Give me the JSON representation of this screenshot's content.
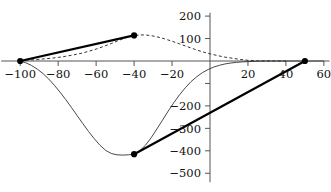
{
  "chart_data": {
    "type": "line",
    "title": "",
    "subtitle": "",
    "xlabel": "",
    "ylabel": "",
    "xlim": [
      -110,
      63
    ],
    "ylim": [
      -540,
      215
    ],
    "grid": false,
    "legend": null,
    "x_ticks": [
      -100,
      -80,
      -60,
      -40,
      -20,
      20,
      40,
      60
    ],
    "x_tick_labels": [
      "-100",
      "-80",
      "-60",
      "-40",
      "-20",
      "20",
      "40",
      "60"
    ],
    "y_ticks": [
      200,
      100,
      -100,
      -200,
      -300,
      -400,
      -500
    ],
    "y_tick_labels": [
      "200",
      "100",
      "",
      "-200",
      "-300",
      "-400",
      "-500"
    ],
    "y_tick_labels_visible": [
      "200",
      "100",
      "-200",
      "-300",
      "-400",
      "-500"
    ],
    "series": [
      {
        "name": "solid-curve",
        "style": "solid-thin",
        "color": "#333333",
        "x": [
          -100,
          -97,
          -94,
          -91,
          -88,
          -85,
          -82,
          -79,
          -76,
          -73,
          -70,
          -67,
          -64,
          -61,
          -58,
          -55,
          -52,
          -49,
          -46,
          -43,
          -40,
          -37,
          -34,
          -31,
          -28,
          -25,
          -22,
          -19,
          -16,
          -13,
          -10,
          -7,
          -4,
          -1,
          2,
          5,
          8,
          11,
          14,
          17,
          20,
          25,
          30,
          35,
          40,
          45,
          50,
          55,
          60
        ],
        "y": [
          0,
          -8,
          -20,
          -36,
          -56,
          -80,
          -108,
          -139,
          -172,
          -207,
          -243,
          -279,
          -314,
          -346,
          -375,
          -398,
          -412,
          -418,
          -419,
          -418,
          -415,
          -400,
          -375,
          -342,
          -303,
          -263,
          -223,
          -185,
          -150,
          -119,
          -92,
          -70,
          -52,
          -38,
          -27,
          -19,
          -13,
          -9,
          -6,
          -4,
          -3,
          -1,
          0,
          0,
          0,
          0,
          0,
          0,
          0
        ]
      },
      {
        "name": "dashed-curve",
        "style": "dashed",
        "color": "#333333",
        "x": [
          -100,
          -96,
          -92,
          -88,
          -84,
          -80,
          -76,
          -72,
          -68,
          -64,
          -60,
          -56,
          -52,
          -48,
          -44,
          -40,
          -37,
          -34,
          -31,
          -28,
          -24,
          -20,
          -16,
          -12,
          -8,
          -4,
          0,
          4,
          8,
          12,
          16,
          20,
          25,
          30,
          35,
          40
        ],
        "y": [
          2,
          4,
          6,
          9,
          12,
          16,
          21,
          27,
          34,
          43,
          53,
          65,
          78,
          92,
          105,
          113,
          116,
          116,
          113,
          108,
          99,
          88,
          76,
          64,
          52,
          41,
          32,
          24,
          17,
          12,
          7,
          3,
          1,
          0,
          0,
          0
        ]
      },
      {
        "name": "chord-upper",
        "style": "solid-thick",
        "color": "#000000",
        "x": [
          -100,
          -40
        ],
        "y": [
          0,
          114
        ]
      },
      {
        "name": "chord-lower",
        "style": "solid-thick",
        "color": "#000000",
        "x": [
          -40,
          50
        ],
        "y": [
          -415,
          0
        ]
      }
    ],
    "markers": [
      {
        "name": "marker-left",
        "x": -100,
        "y": 0
      },
      {
        "name": "marker-top",
        "x": -40,
        "y": 114
      },
      {
        "name": "marker-bottom",
        "x": -40,
        "y": -415
      },
      {
        "name": "marker-right",
        "x": 50,
        "y": 0
      }
    ],
    "axes": {
      "x_axis_y_value": 0,
      "y_axis_x_value": 0,
      "axis_color": "#555555"
    }
  }
}
